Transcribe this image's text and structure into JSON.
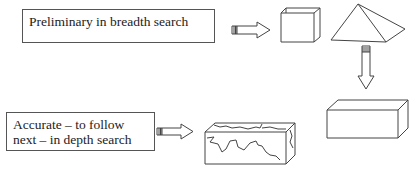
{
  "diagram": {
    "stage1": {
      "label": "Preliminary in breadth search",
      "shapes": [
        "cube",
        "pyramid"
      ]
    },
    "stage2": {
      "shape": "rectangular-block"
    },
    "stage3": {
      "label": "Accurate – to follow next – in depth search",
      "label_line1": "Accurate – to follow",
      "label_line2": "next – in depth search",
      "shape": "cracked-rectangular-block"
    },
    "colors": {
      "stroke": "#444444",
      "background": "#ffffff"
    }
  }
}
